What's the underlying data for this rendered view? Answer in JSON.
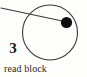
{
  "figure": {
    "caption": "read block",
    "step_label": "3",
    "colors": {
      "background": "#fdfdfc",
      "stroke": "#3a3a3a",
      "dot_fill": "#0d0d0d",
      "text": "#2b2b2b",
      "step_text": "#1a1a1a"
    },
    "icons": {
      "disk-platter-icon": "circle",
      "disk-head-arm-icon": "line",
      "disk-block-marker-icon": "filled-circle"
    },
    "geometry": {
      "platter": {
        "cx": 50,
        "cy": 32.5,
        "r": 27.5,
        "stroke_width": 1.1
      },
      "arm_line": {
        "x1": 1,
        "y1": 8,
        "x2": 67,
        "y2": 22,
        "stroke_width": 1.1
      },
      "block_dot": {
        "cx": 66.5,
        "cy": 22.5,
        "r": 5.6
      }
    }
  }
}
